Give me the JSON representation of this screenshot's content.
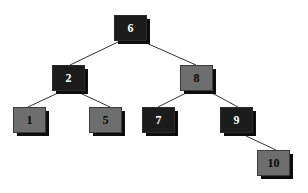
{
  "diagram": {
    "type": "binary-search-tree",
    "colors": {
      "dark_node": "#1c1c1c",
      "gray_node": "#6e6e6e",
      "shadow": "#0d0d0d",
      "edge": "#333333",
      "background": "#ffffff"
    },
    "nodes": [
      {
        "id": "n6",
        "label": "6",
        "style": "dark",
        "x": 114,
        "y": 15
      },
      {
        "id": "n2",
        "label": "2",
        "style": "dark",
        "x": 52,
        "y": 65
      },
      {
        "id": "n8",
        "label": "8",
        "style": "gray",
        "x": 180,
        "y": 65
      },
      {
        "id": "n1",
        "label": "1",
        "style": "gray",
        "x": 13,
        "y": 107
      },
      {
        "id": "n5",
        "label": "5",
        "style": "gray",
        "x": 89,
        "y": 107
      },
      {
        "id": "n7",
        "label": "7",
        "style": "dark",
        "x": 142,
        "y": 107
      },
      {
        "id": "n9",
        "label": "9",
        "style": "dark",
        "x": 220,
        "y": 107
      },
      {
        "id": "n10",
        "label": "10",
        "style": "gray",
        "x": 257,
        "y": 150
      }
    ],
    "edges": [
      {
        "from": "6",
        "to": "2"
      },
      {
        "from": "6",
        "to": "8"
      },
      {
        "from": "2",
        "to": "1"
      },
      {
        "from": "2",
        "to": "5"
      },
      {
        "from": "8",
        "to": "7"
      },
      {
        "from": "8",
        "to": "9"
      },
      {
        "from": "9",
        "to": "10"
      }
    ]
  }
}
